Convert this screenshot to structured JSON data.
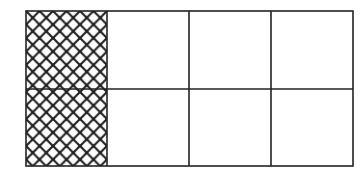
{
  "diagram": {
    "type": "fraction-grid",
    "rows": 2,
    "columns": 4,
    "total_cells": 8,
    "shaded_cells": 2,
    "shaded_pattern": "diagonal-crosshatch",
    "shaded_positions": [
      [
        0,
        0
      ],
      [
        1,
        0
      ]
    ],
    "shaded_fraction": "2/8",
    "colors": {
      "line": "#222222",
      "background": "#ffffff"
    }
  }
}
